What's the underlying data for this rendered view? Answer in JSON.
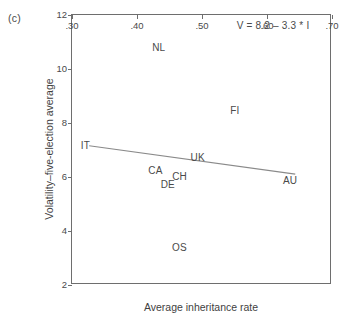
{
  "panel": {
    "label": "(c)"
  },
  "chart_data": {
    "type": "scatter",
    "title": "",
    "subtitle": "",
    "xlabel": "Average inheritance rate",
    "ylabel": "Volatility–five-election average",
    "xlim": [
      0.3,
      0.7
    ],
    "ylim": [
      2,
      12
    ],
    "xticks": [
      ".30",
      ".40",
      ".50",
      ".60",
      ".70"
    ],
    "xtick_values": [
      0.3,
      0.4,
      0.5,
      0.6,
      0.7
    ],
    "yticks": [
      "2",
      "4",
      "6",
      "8",
      "10",
      "12"
    ],
    "ytick_values": [
      2,
      4,
      6,
      8,
      10,
      12
    ],
    "grid": false,
    "legend": "none",
    "point_label_mode": "text-only-no-marker",
    "points": [
      {
        "label": "IT",
        "x": 0.322,
        "y": 7.1
      },
      {
        "label": "NL",
        "x": 0.435,
        "y": 10.75
      },
      {
        "label": "FI",
        "x": 0.552,
        "y": 8.4
      },
      {
        "label": "UK",
        "x": 0.495,
        "y": 6.65
      },
      {
        "label": "CA",
        "x": 0.43,
        "y": 6.2
      },
      {
        "label": "CH",
        "x": 0.467,
        "y": 5.98
      },
      {
        "label": "DE",
        "x": 0.449,
        "y": 5.65
      },
      {
        "label": "AU",
        "x": 0.637,
        "y": 5.8
      },
      {
        "label": "OS",
        "x": 0.467,
        "y": 3.35
      }
    ],
    "fit_line": {
      "equation_text": "V = 8.2 – 3.3 * I",
      "intercept": 8.2,
      "slope": -3.3,
      "x_start": 0.328,
      "x_end": 0.645,
      "y_start": 7.12,
      "y_end": 6.07
    },
    "annotations": [
      {
        "name": "regression-equation",
        "text": "V = 8.2 – 3.3 * I",
        "x": 0.555,
        "y": 11.55
      }
    ],
    "colors": {
      "axis": "#6e6e6e",
      "text": "#4a4a4a",
      "line": "#8a8a8a",
      "background": "#ffffff"
    }
  }
}
